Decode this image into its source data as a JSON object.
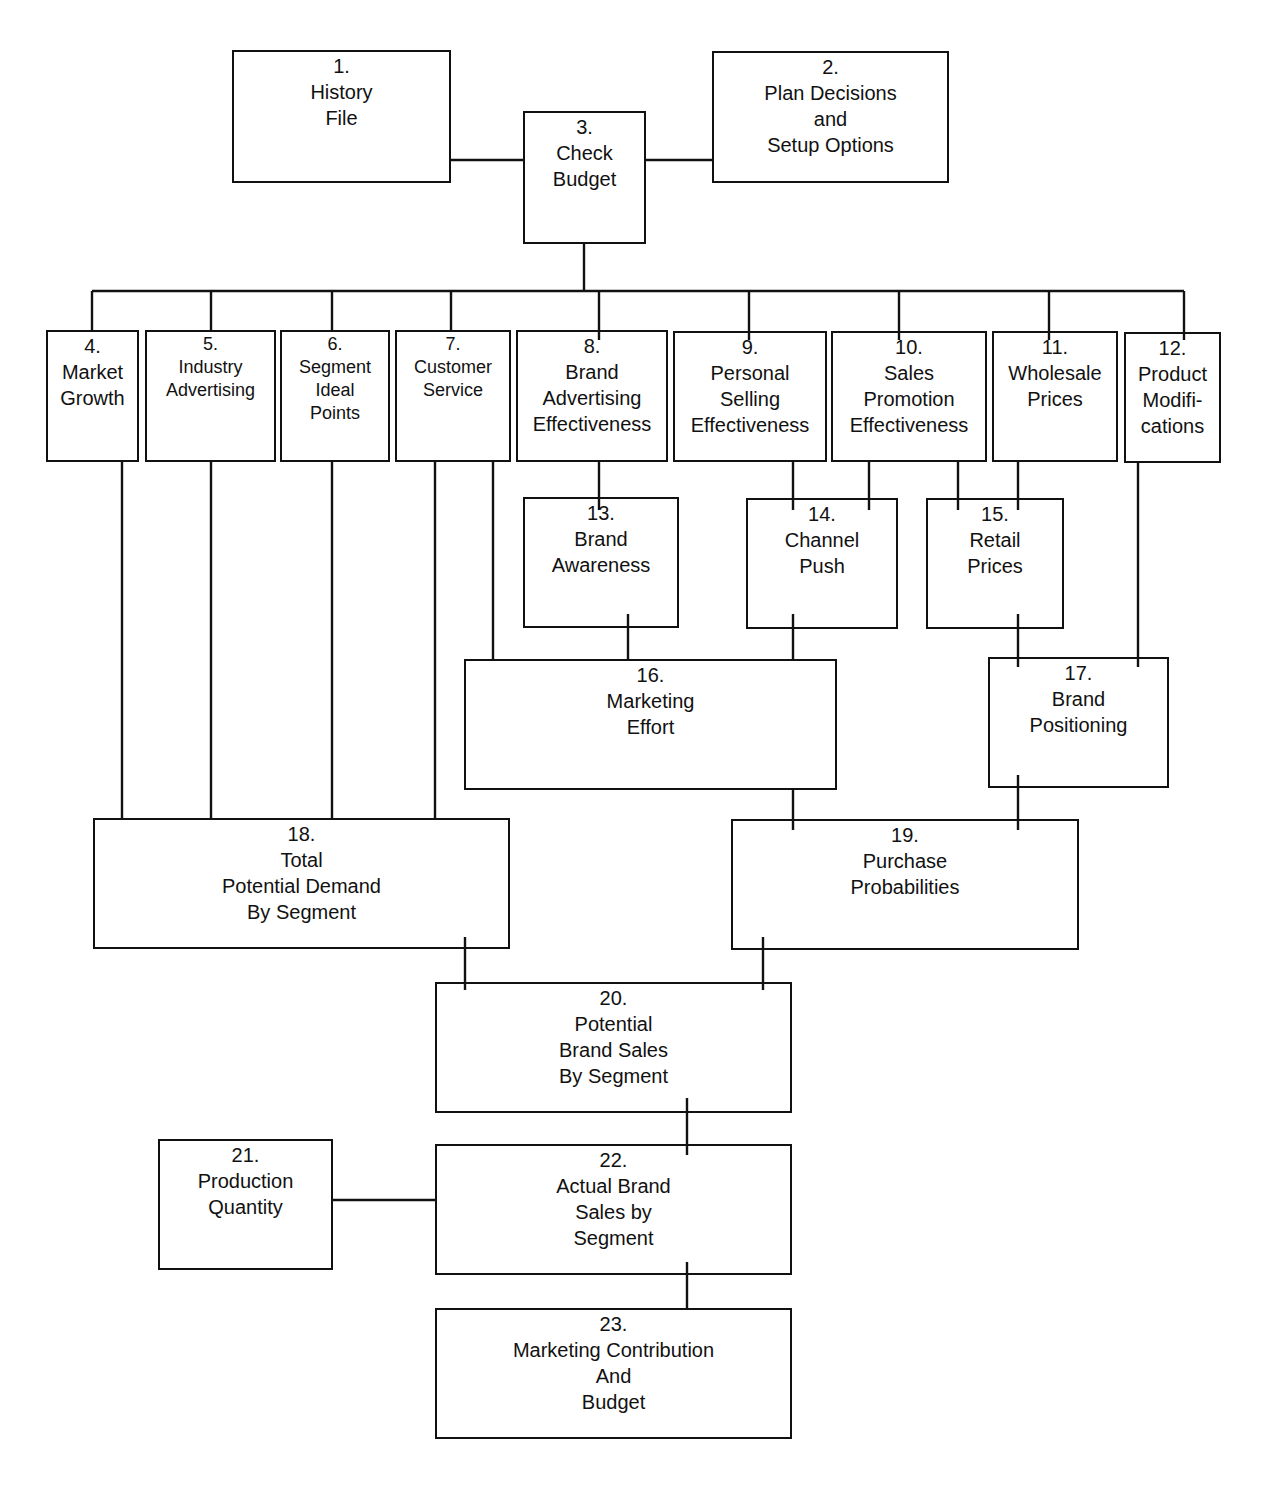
{
  "diagram": {
    "type": "flowchart",
    "nodes": [
      {
        "id": 1,
        "num": "1.",
        "label": "History\nFile",
        "x": 232,
        "y": 50,
        "w": 219,
        "h": 133
      },
      {
        "id": 2,
        "num": "2.",
        "label": "Plan Decisions\nand\nSetup Options",
        "x": 712,
        "y": 51,
        "w": 237,
        "h": 132
      },
      {
        "id": 3,
        "num": "3.",
        "label": "Check\nBudget",
        "x": 523,
        "y": 111,
        "w": 123,
        "h": 133
      },
      {
        "id": 4,
        "num": "4.",
        "label": "Market\nGrowth",
        "x": 46,
        "y": 330,
        "w": 93,
        "h": 132
      },
      {
        "id": 5,
        "num": "5.",
        "label": "Industry\nAdvertising",
        "x": 145,
        "y": 330,
        "w": 131,
        "h": 132,
        "small": true
      },
      {
        "id": 6,
        "num": "6.",
        "label": "Segment\nIdeal\nPoints",
        "x": 280,
        "y": 330,
        "w": 110,
        "h": 132,
        "small": true
      },
      {
        "id": 7,
        "num": "7.",
        "label": "Customer\nService",
        "x": 395,
        "y": 330,
        "w": 116,
        "h": 132,
        "small": true
      },
      {
        "id": 8,
        "num": "8.",
        "label": "Brand\nAdvertising\nEffectiveness",
        "x": 516,
        "y": 330,
        "w": 152,
        "h": 132
      },
      {
        "id": 9,
        "num": "9.",
        "label": "Personal\nSelling\nEffectiveness",
        "x": 673,
        "y": 331,
        "w": 154,
        "h": 131
      },
      {
        "id": 10,
        "num": "10.",
        "label": "Sales\nPromotion\nEffectiveness",
        "x": 831,
        "y": 331,
        "w": 156,
        "h": 131
      },
      {
        "id": 11,
        "num": "11.",
        "label": "Wholesale\nPrices",
        "x": 992,
        "y": 331,
        "w": 126,
        "h": 131
      },
      {
        "id": 12,
        "num": "12.",
        "label": "Product\nModifi-\ncations",
        "x": 1124,
        "y": 332,
        "w": 97,
        "h": 131
      },
      {
        "id": 13,
        "num": "13.",
        "label": "Brand\nAwareness",
        "x": 523,
        "y": 497,
        "w": 156,
        "h": 131
      },
      {
        "id": 14,
        "num": "14.",
        "label": "Channel\nPush",
        "x": 746,
        "y": 498,
        "w": 152,
        "h": 131
      },
      {
        "id": 15,
        "num": "15.",
        "label": "Retail\nPrices",
        "x": 926,
        "y": 498,
        "w": 138,
        "h": 131
      },
      {
        "id": 16,
        "num": "16.",
        "label": "Marketing\nEffort",
        "x": 464,
        "y": 659,
        "w": 373,
        "h": 131
      },
      {
        "id": 17,
        "num": "17.",
        "label": "Brand\nPositioning",
        "x": 988,
        "y": 657,
        "w": 181,
        "h": 131
      },
      {
        "id": 18,
        "num": "18.",
        "label": "Total\nPotential Demand\nBy Segment",
        "x": 93,
        "y": 818,
        "w": 417,
        "h": 131
      },
      {
        "id": 19,
        "num": "19.",
        "label": "Purchase\nProbabilities",
        "x": 731,
        "y": 819,
        "w": 348,
        "h": 131
      },
      {
        "id": 20,
        "num": "20.",
        "label": "Potential\nBrand Sales\nBy Segment",
        "x": 435,
        "y": 982,
        "w": 357,
        "h": 131
      },
      {
        "id": 21,
        "num": "21.",
        "label": "Production\nQuantity",
        "x": 158,
        "y": 1139,
        "w": 175,
        "h": 131
      },
      {
        "id": 22,
        "num": "22.",
        "label": "Actual Brand\nSales by\nSegment",
        "x": 435,
        "y": 1144,
        "w": 357,
        "h": 131
      },
      {
        "id": 23,
        "num": "23.",
        "label": "Marketing Contribution\nAnd\nBudget",
        "x": 435,
        "y": 1308,
        "w": 357,
        "h": 131
      }
    ],
    "connectors": [
      {
        "from": 1,
        "to": 3
      },
      {
        "from": 3,
        "to": 2
      },
      {
        "from": 3,
        "to": 4
      },
      {
        "from": 3,
        "to": 5
      },
      {
        "from": 3,
        "to": 6
      },
      {
        "from": 3,
        "to": 7
      },
      {
        "from": 3,
        "to": 8
      },
      {
        "from": 3,
        "to": 9
      },
      {
        "from": 3,
        "to": 10
      },
      {
        "from": 3,
        "to": 11
      },
      {
        "from": 3,
        "to": 12
      },
      {
        "from": 8,
        "to": 13
      },
      {
        "from": 9,
        "to": 14
      },
      {
        "from": 10,
        "to": 14
      },
      {
        "from": 10,
        "to": 15
      },
      {
        "from": 11,
        "to": 15
      },
      {
        "from": 7,
        "to": 16
      },
      {
        "from": 13,
        "to": 16
      },
      {
        "from": 14,
        "to": 16
      },
      {
        "from": 15,
        "to": 17
      },
      {
        "from": 12,
        "to": 17
      },
      {
        "from": 4,
        "to": 18
      },
      {
        "from": 5,
        "to": 18
      },
      {
        "from": 6,
        "to": 18
      },
      {
        "from": 7,
        "to": 18
      },
      {
        "from": 16,
        "to": 19
      },
      {
        "from": 17,
        "to": 19
      },
      {
        "from": 18,
        "to": 20
      },
      {
        "from": 19,
        "to": 20
      },
      {
        "from": 20,
        "to": 22
      },
      {
        "from": 21,
        "to": 22
      },
      {
        "from": 22,
        "to": 23
      }
    ],
    "segments": [
      [
        451,
        160,
        523,
        160
      ],
      [
        646,
        160,
        712,
        160
      ],
      [
        584,
        244,
        584,
        291
      ],
      [
        92,
        291,
        1184,
        291
      ],
      [
        92,
        291,
        92,
        330
      ],
      [
        211,
        291,
        211,
        330
      ],
      [
        332,
        291,
        332,
        330
      ],
      [
        451,
        291,
        451,
        330
      ],
      [
        599,
        291,
        599,
        340
      ],
      [
        749,
        291,
        749,
        340
      ],
      [
        899,
        291,
        899,
        340
      ],
      [
        1049,
        291,
        1049,
        340
      ],
      [
        1184,
        291,
        1184,
        340
      ],
      [
        599,
        462,
        599,
        510
      ],
      [
        793,
        462,
        793,
        510
      ],
      [
        869,
        462,
        869,
        510
      ],
      [
        958,
        462,
        958,
        510
      ],
      [
        1018,
        462,
        1018,
        510
      ],
      [
        628,
        614,
        628,
        659
      ],
      [
        793,
        614,
        793,
        659
      ],
      [
        493,
        462,
        493,
        659
      ],
      [
        1018,
        614,
        1018,
        667
      ],
      [
        1138,
        462,
        1138,
        667
      ],
      [
        122,
        462,
        122,
        818
      ],
      [
        211,
        462,
        211,
        818
      ],
      [
        332,
        462,
        332,
        818
      ],
      [
        435,
        462,
        435,
        818
      ],
      [
        793,
        788,
        793,
        830
      ],
      [
        1018,
        775,
        1018,
        830
      ],
      [
        465,
        937,
        465,
        990
      ],
      [
        763,
        937,
        763,
        990
      ],
      [
        687,
        1098,
        687,
        1155
      ],
      [
        333,
        1200,
        435,
        1200
      ],
      [
        687,
        1262,
        687,
        1308
      ]
    ]
  }
}
